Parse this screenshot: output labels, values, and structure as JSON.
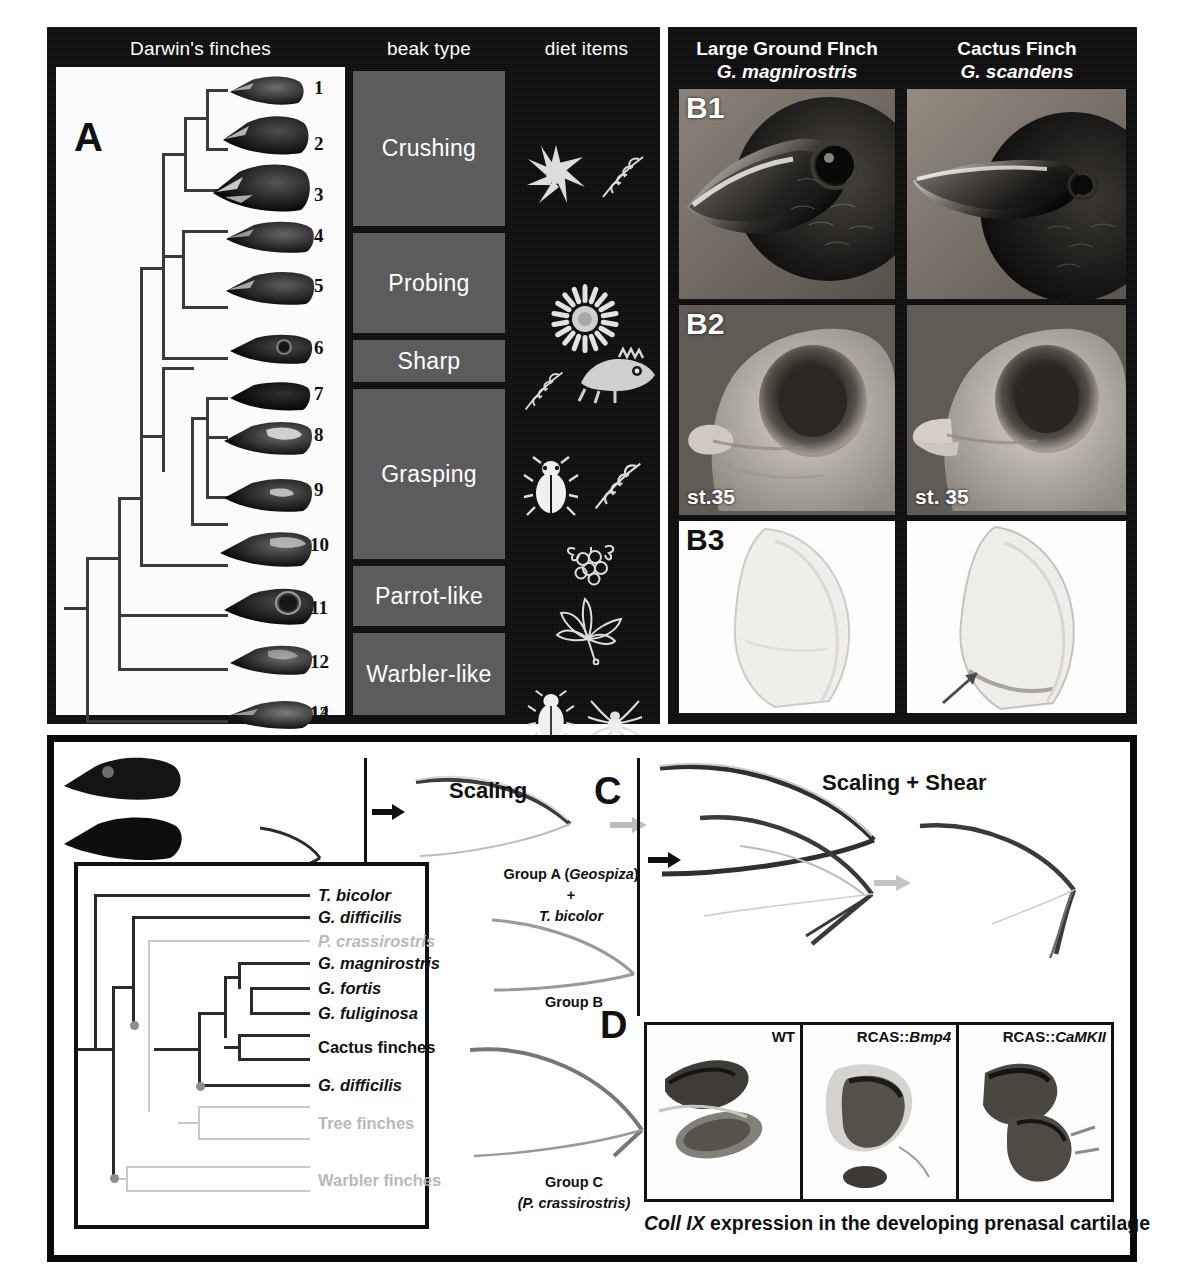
{
  "figure": {
    "domain": "scientific-figure",
    "colors": {
      "black": "#0a0a0a",
      "beak_type_gray": "#5c5c5c",
      "white": "#ffffff",
      "tree_gray": "#c9c9c9"
    }
  },
  "panel_a": {
    "label": "A",
    "column_headers": {
      "finches": "Darwin's finches",
      "beak": "beak type",
      "diet": "diet items"
    },
    "beak_numbers": [
      "1",
      "2",
      "3",
      "4",
      "5",
      "6",
      "7",
      "8",
      "9",
      "10",
      "11",
      "12",
      "13",
      "14"
    ],
    "beak_types": [
      {
        "label": "Crushing",
        "span": 3
      },
      {
        "label": "Probing",
        "span": 2
      },
      {
        "label": "Sharp",
        "span": 1
      },
      {
        "label": "Grasping",
        "span": 4
      },
      {
        "label": "Parrot-like",
        "span": 2
      },
      {
        "label": "Warbler-like",
        "span": 2
      }
    ],
    "diet_items": [
      "spiky-seed-icon",
      "grain-ear-icon",
      "flower-icon",
      "grain-ear-icon",
      "lizard-icon",
      "beetle-icon",
      "grain-ear-icon",
      "berries-icon",
      "leaf-icon",
      "insect-icon",
      "spider-icon",
      "butterfly-icon"
    ]
  },
  "panel_b": {
    "columns": [
      {
        "common_name": "Large Ground FInch",
        "species": "G. magnirostris",
        "stage": "st.35"
      },
      {
        "common_name": "Cactus Finch",
        "species": "G. scandens",
        "stage": "st. 35"
      }
    ],
    "row_labels": [
      "B1",
      "B2",
      "B3"
    ]
  },
  "panel_c": {
    "label": "C",
    "left_title": "Scaling",
    "right_title": "Scaling + Shear",
    "group_labels": [
      {
        "line1": "Group A (",
        "em1": "Geospiza",
        "line1b": ")",
        "plus": "+",
        "line2": "T. bicolor",
        "line2_italic": true
      },
      {
        "line1": "Group B",
        "em1": "",
        "line1b": "",
        "plus": "",
        "line2": "",
        "line2_italic": false
      },
      {
        "line1": "Group C",
        "em1": "",
        "line1b": "",
        "plus": "",
        "line2": "(P. crassirostris)",
        "line2_italic": true
      }
    ]
  },
  "tree": {
    "taxa": [
      {
        "name": "T. bicolor",
        "style": "italic",
        "muted": false
      },
      {
        "name": "G. difficilis",
        "style": "italic",
        "muted": false
      },
      {
        "name": "P. crassirostris",
        "style": "italic",
        "muted": true
      },
      {
        "name": "G. magnirostris",
        "style": "italic",
        "muted": false
      },
      {
        "name": "G. fortis",
        "style": "italic",
        "muted": false
      },
      {
        "name": "G. fuliginosa",
        "style": "italic",
        "muted": false
      },
      {
        "name": "Cactus finches",
        "style": "roman",
        "muted": false
      },
      {
        "name": "G. difficilis",
        "style": "italic",
        "muted": false
      },
      {
        "name": "Tree finches",
        "style": "roman",
        "muted": true
      },
      {
        "name": "Warbler finches",
        "style": "roman",
        "muted": true
      }
    ]
  },
  "panel_d": {
    "label": "D",
    "cells": [
      {
        "label_prefix": "WT",
        "label_gene": ""
      },
      {
        "label_prefix": "RCAS::",
        "label_gene": "Bmp4"
      },
      {
        "label_prefix": "RCAS::",
        "label_gene": "CaMKII"
      }
    ],
    "caption_gene": "Coll IX",
    "caption_rest": " expression in the developing prenasal cartilage"
  }
}
